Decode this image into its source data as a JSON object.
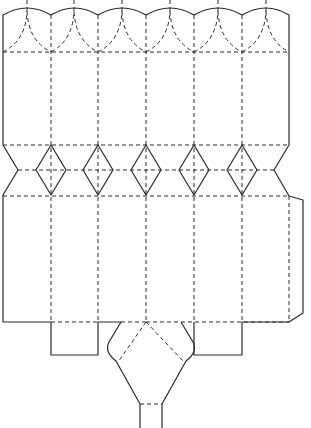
{
  "diagram": {
    "type": "papercraft-net",
    "colors": {
      "background": "#ffffff",
      "line": "#2a2a2a"
    },
    "line_styles": {
      "cut": "solid",
      "fold": "dashed"
    },
    "columns_x": [
      3,
      51,
      98,
      146,
      194,
      242,
      289
    ],
    "rows_y": {
      "top_peak": 7,
      "top_valley": 15,
      "top_fold": 52,
      "band_top": 145,
      "band_mid": 170,
      "band_bottom": 195,
      "bottom_edge": 322,
      "tab_bottom": 355
    },
    "panel_count": 6,
    "diamond_count": 5,
    "scallop_count": 6,
    "parts": [
      {
        "name": "top-scallop-flaps",
        "count": 6
      },
      {
        "name": "upper-body-panels",
        "count": 6
      },
      {
        "name": "diamond-crimp-band",
        "count": 5
      },
      {
        "name": "lower-body-panels",
        "count": 6
      },
      {
        "name": "glue-tab-right",
        "count": 1
      },
      {
        "name": "bottom-square-tabs",
        "count": 2
      },
      {
        "name": "bottom-hexagon-flap",
        "count": 1
      }
    ]
  }
}
